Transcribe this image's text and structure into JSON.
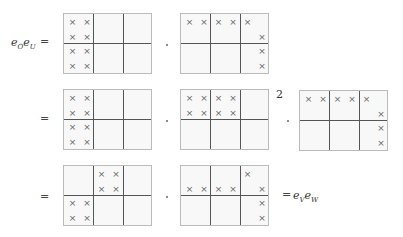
{
  "equation": {
    "lhs_label": {
      "base1": "e",
      "sub1": "O",
      "base2": "e",
      "sub2": "U"
    },
    "equals": "=",
    "product_symbol": "·",
    "exponent": "2",
    "rhs_label": {
      "base1": "e",
      "sub1": "V",
      "base2": "e",
      "sub2": "W"
    },
    "rows": [
      {
        "prefix": "e_O e_U =",
        "matrices": [
          {
            "cells": [
              [
                0,
                0
              ],
              [
                0,
                1
              ],
              [
                1,
                0
              ],
              [
                1,
                1
              ],
              [
                2,
                0
              ],
              [
                2,
                1
              ],
              [
                3,
                0
              ],
              [
                3,
                1
              ]
            ]
          },
          {
            "cells": [
              [
                0,
                0
              ],
              [
                0,
                1
              ],
              [
                0,
                2
              ],
              [
                0,
                3
              ],
              [
                0,
                4
              ],
              [
                1,
                5
              ],
              [
                2,
                5
              ],
              [
                3,
                5
              ]
            ]
          }
        ]
      },
      {
        "prefix": "=",
        "matrices": [
          {
            "cells": [
              [
                0,
                0
              ],
              [
                0,
                1
              ],
              [
                1,
                0
              ],
              [
                1,
                1
              ],
              [
                2,
                0
              ],
              [
                2,
                1
              ],
              [
                3,
                0
              ],
              [
                3,
                1
              ]
            ]
          },
          {
            "cells": [
              [
                0,
                0
              ],
              [
                0,
                1
              ],
              [
                0,
                2
              ],
              [
                0,
                3
              ],
              [
                1,
                0
              ],
              [
                1,
                1
              ],
              [
                1,
                2
              ],
              [
                1,
                3
              ]
            ],
            "exponent": "2"
          },
          {
            "cells": [
              [
                0,
                0
              ],
              [
                0,
                1
              ],
              [
                0,
                2
              ],
              [
                0,
                3
              ],
              [
                0,
                4
              ],
              [
                1,
                5
              ],
              [
                2,
                5
              ],
              [
                3,
                5
              ]
            ]
          }
        ]
      },
      {
        "prefix": "=",
        "suffix": "= e_V e_W",
        "matrices": [
          {
            "cells": [
              [
                0,
                2
              ],
              [
                0,
                3
              ],
              [
                1,
                2
              ],
              [
                1,
                3
              ],
              [
                2,
                0
              ],
              [
                2,
                1
              ],
              [
                3,
                0
              ],
              [
                3,
                1
              ]
            ]
          },
          {
            "cells": [
              [
                0,
                4
              ],
              [
                1,
                0
              ],
              [
                1,
                1
              ],
              [
                1,
                2
              ],
              [
                1,
                3
              ],
              [
                1,
                5
              ],
              [
                2,
                5
              ],
              [
                3,
                5
              ]
            ]
          }
        ]
      }
    ],
    "cell_mark": "×"
  }
}
